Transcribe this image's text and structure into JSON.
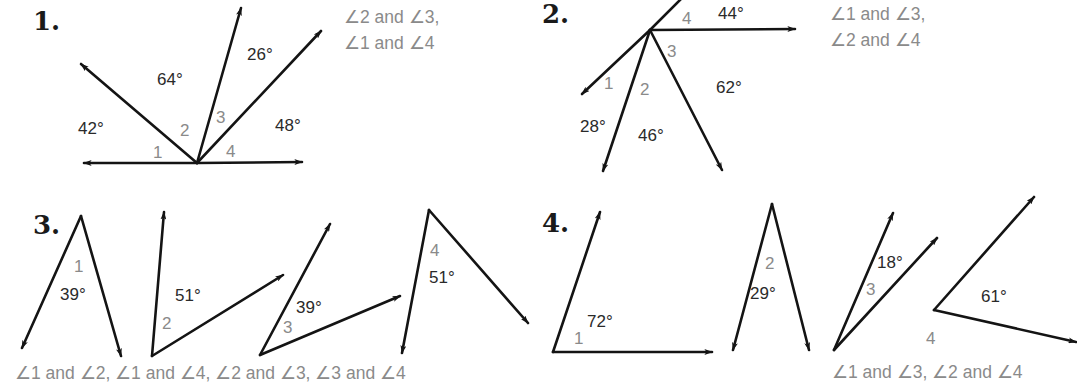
{
  "problems": [
    {
      "number": "1.",
      "degrees": [
        "42°",
        "64°",
        "26°",
        "48°"
      ],
      "angle_labels": [
        "1",
        "2",
        "3",
        "4"
      ],
      "answer_lines": [
        "∠2 and ∠3,",
        "∠1 and ∠4"
      ]
    },
    {
      "number": "2.",
      "degrees": [
        "44°",
        "62°",
        "28°",
        "46°"
      ],
      "angle_labels": [
        "1",
        "2",
        "3",
        "4"
      ],
      "answer_lines": [
        "∠1 and ∠3,",
        "∠2 and ∠4"
      ]
    },
    {
      "number": "3.",
      "degrees": [
        "39°",
        "51°",
        "39°",
        "51°"
      ],
      "angle_labels": [
        "1",
        "2",
        "3",
        "4"
      ],
      "answer_lines": [
        "∠1 and ∠2, ∠1 and ∠4, ∠2 and ∠3, ∠3 and ∠4"
      ]
    },
    {
      "number": "4.",
      "degrees": [
        "72°",
        "29°",
        "18°",
        "61°"
      ],
      "angle_labels": [
        "1",
        "2",
        "3",
        "4"
      ],
      "answer_lines": [
        "∠1 and ∠3, ∠2 and ∠4"
      ]
    }
  ]
}
